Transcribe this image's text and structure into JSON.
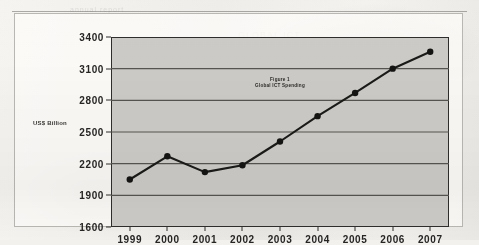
{
  "chart_data": {
    "type": "line",
    "title": "Figure 1",
    "subtitle": "Global ICT Spending",
    "xlabel": "",
    "ylabel": "US$ Billion",
    "categories": [
      "1999",
      "2000",
      "2001",
      "2002",
      "2003",
      "2004",
      "2005",
      "2006",
      "2007"
    ],
    "values": [
      2050,
      2270,
      2120,
      2185,
      2410,
      2650,
      2870,
      3100,
      3260
    ],
    "series": [
      {
        "name": "Global ICT Spending",
        "values": [
          2050,
          2270,
          2120,
          2185,
          2410,
          2650,
          2870,
          3100,
          3260
        ]
      }
    ],
    "ylim": [
      1600,
      3400
    ],
    "ytick_step": 300,
    "ytick_labels": [
      "3400",
      "3100",
      "2800",
      "2500",
      "2200",
      "1900",
      "1600"
    ],
    "xtick_labels": [
      "1999",
      "2000",
      "2001",
      "2002",
      "2003",
      "2004",
      "2005",
      "2006",
      "2007"
    ],
    "grid": "horizontal",
    "legend": "none",
    "marker": "filled-circle",
    "colors": {
      "line": "#1a1a18",
      "marker": "#141413",
      "plot_background": "#cbcac6",
      "grid": "#56544f",
      "axis": "#2e2d2b",
      "text": "#262524",
      "page_background": "#f2f1ee"
    }
  },
  "page": {
    "ghost_text_a": "GLOBAL ICT",
    "ghost_text_b": "SPEND",
    "ghost_text_c": "2007",
    "ghost_text_d": "annual report"
  }
}
